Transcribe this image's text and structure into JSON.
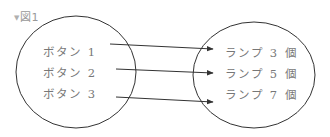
{
  "figure": {
    "caption": "図1",
    "toggle_icon": "triangle-down-icon",
    "left_set": {
      "items": [
        "ボタン 1",
        "ボタン 2",
        "ボタン 3"
      ]
    },
    "right_set": {
      "items": [
        "ランプ 3 個",
        "ランプ 5 個",
        "ランプ 7 個"
      ]
    },
    "mappings": [
      {
        "from": "ボタン 1",
        "to": "ランプ 3 個"
      },
      {
        "from": "ボタン 2",
        "to": "ランプ 5 個"
      },
      {
        "from": "ボタン 3",
        "to": "ランプ 7 個"
      }
    ],
    "colors": {
      "stroke": "#333333",
      "text": "#777777",
      "caption": "#999999"
    }
  }
}
